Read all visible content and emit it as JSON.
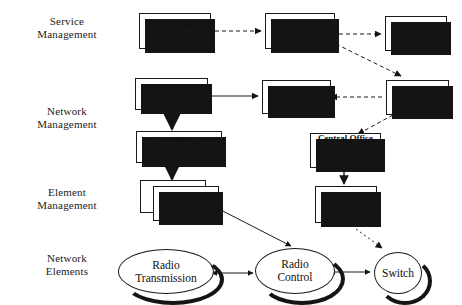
{
  "diagram": {
    "background_color": "#ffffff",
    "line_color": "#1a1a1a",
    "shadow_color": "#141414",
    "layer_labels": [
      {
        "id": "service-management",
        "text": "Service\nManagement"
      },
      {
        "id": "network-management",
        "text": "Network\nManagement"
      },
      {
        "id": "element-management",
        "text": "Element\nManagement"
      },
      {
        "id": "network-elements",
        "text": "Network\nElements"
      }
    ],
    "boxes": [
      {
        "id": "customer-contact",
        "text": "Customer\nContact"
      },
      {
        "id": "service-request",
        "text": "Service\nRequest"
      },
      {
        "id": "billing",
        "text": "Billing"
      },
      {
        "id": "surveillance",
        "text": "Surveillance"
      },
      {
        "id": "force",
        "text": "Force"
      },
      {
        "id": "activation-control",
        "text": "Activation\nControl"
      },
      {
        "id": "radio-network-management",
        "text": "Radio Network\nManagement"
      },
      {
        "id": "central-office-assignment",
        "text_line1": "Central Office",
        "text_line2": "Assignment"
      },
      {
        "id": "radio-em",
        "text": "Radio\nEM"
      },
      {
        "id": "switch-em",
        "text": "Switch\nEM"
      }
    ],
    "ellipses": [
      {
        "id": "radio-transmission",
        "text": "Radio\nTransmission"
      },
      {
        "id": "radio-control",
        "text": "Radio\nControl"
      },
      {
        "id": "switch",
        "text": "Switch"
      }
    ],
    "connections": [
      {
        "from": "customer-contact",
        "to": "service-request",
        "style": "dashed",
        "arrow": "single"
      },
      {
        "from": "service-request",
        "to": "billing",
        "style": "dashed",
        "arrow": "single"
      },
      {
        "from": "service-request",
        "to": "activation-control",
        "style": "dashed",
        "arrow": "single"
      },
      {
        "from": "activation-control",
        "to": "force",
        "style": "dashed",
        "arrow": "single"
      },
      {
        "from": "activation-control",
        "to": "central-office-assignment",
        "style": "dashed",
        "arrow": "single"
      },
      {
        "from": "surveillance",
        "to": "force",
        "style": "solid",
        "arrow": "single"
      },
      {
        "from": "surveillance",
        "to": "radio-network-management",
        "style": "solid",
        "arrow": "single"
      },
      {
        "from": "radio-network-management",
        "to": "radio-em",
        "style": "solid",
        "arrow": "single"
      },
      {
        "from": "central-office-assignment",
        "to": "switch-em",
        "style": "solid",
        "arrow": "single"
      },
      {
        "from": "radio-em",
        "to": "radio-control",
        "style": "solid",
        "arrow": "double"
      },
      {
        "from": "switch-em",
        "to": "switch",
        "style": "dashed",
        "arrow": "single"
      },
      {
        "from": "radio-transmission",
        "to": "radio-control",
        "style": "solid",
        "arrow": "double"
      },
      {
        "from": "radio-control",
        "to": "switch",
        "style": "solid",
        "arrow": "double"
      }
    ]
  }
}
